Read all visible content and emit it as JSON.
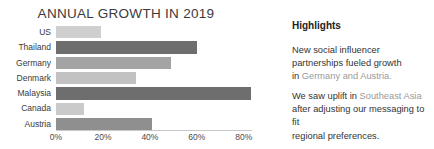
{
  "chart_data": {
    "type": "bar",
    "orientation": "horizontal",
    "title": "ANNUAL GROWTH IN 2019",
    "xlabel": "",
    "ylabel": "",
    "categories": [
      "US",
      "Thailand",
      "Germany",
      "Denmark",
      "Malaysia",
      "Canada",
      "Austria"
    ],
    "values": [
      19,
      60,
      49,
      34,
      83,
      12,
      41
    ],
    "value_suffix": "%",
    "xlim": [
      0,
      83.5
    ],
    "xticks": [
      0,
      20,
      40,
      60,
      80
    ],
    "xtick_labels": [
      "0%",
      "20%",
      "40%",
      "60%",
      "80%"
    ],
    "grid": false,
    "legend": "none",
    "bar_colors": [
      "#cfcfcf",
      "#6e6e6e",
      "#a3a3a3",
      "#c2c2c2",
      "#6e6e6e",
      "#cacaca",
      "#8f8f8f"
    ]
  },
  "highlights": {
    "title": "Highlights",
    "note_1": {
      "line_1": "New social influencer",
      "line_2": "partnerships fueled growth",
      "line_3_prefix": "in ",
      "line_3_accent": "Germany and Austria."
    },
    "note_2": {
      "line_1_prefix": "We saw uplift in ",
      "line_1_accent": "Southeast Asia",
      "line_2": "after adjusting our messaging to fit",
      "line_3": "regional preferences."
    }
  },
  "colors": {
    "background": "#ffffff",
    "text": "#333333",
    "muted": "#9a9a9a",
    "axis": "#c9c9c9"
  }
}
